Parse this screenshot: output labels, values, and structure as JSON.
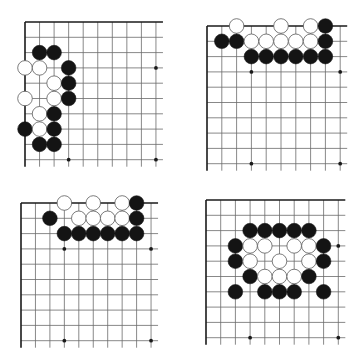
{
  "diagram": {
    "colors": {
      "background": "#ffffff",
      "grid": "#6a6a6a",
      "edge": "#1a1a1a",
      "black_stone": "#141414",
      "white_stone": "#ffffff",
      "white_outline": "#5a5a5a"
    },
    "stone_radius": 7.3,
    "boards": [
      {
        "name": "board-top-left",
        "origin": [
          25,
          22
        ],
        "step": [
          14.55,
          15.3
        ],
        "size": [
          10,
          10
        ],
        "edges": [
          "top",
          "left"
        ],
        "overhang": 7,
        "star_points": [
          [
            9,
            3
          ],
          [
            3,
            9
          ],
          [
            9,
            9
          ]
        ],
        "stones": [
          {
            "c": 1,
            "r": 2,
            "color": "black"
          },
          {
            "c": 2,
            "r": 2,
            "color": "black"
          },
          {
            "c": 0,
            "r": 3,
            "color": "white"
          },
          {
            "c": 1,
            "r": 3,
            "color": "white"
          },
          {
            "c": 3,
            "r": 3,
            "color": "black"
          },
          {
            "c": 2,
            "r": 4,
            "color": "white"
          },
          {
            "c": 3,
            "r": 4,
            "color": "black"
          },
          {
            "c": 0,
            "r": 5,
            "color": "white"
          },
          {
            "c": 2,
            "r": 5,
            "color": "white"
          },
          {
            "c": 3,
            "r": 5,
            "color": "black"
          },
          {
            "c": 1,
            "r": 6,
            "color": "white"
          },
          {
            "c": 2,
            "r": 6,
            "color": "black"
          },
          {
            "c": 0,
            "r": 7,
            "color": "black"
          },
          {
            "c": 1,
            "r": 7,
            "color": "white"
          },
          {
            "c": 2,
            "r": 7,
            "color": "black"
          },
          {
            "c": 1,
            "r": 8,
            "color": "black"
          },
          {
            "c": 2,
            "r": 8,
            "color": "black"
          }
        ]
      },
      {
        "name": "board-top-right",
        "origin": [
          207,
          26
        ],
        "step": [
          14.8,
          15.3
        ],
        "size": [
          10,
          10
        ],
        "edges": [
          "top",
          "left"
        ],
        "overhang": 7,
        "star_points": [
          [
            3,
            3
          ],
          [
            9,
            3
          ],
          [
            3,
            9
          ],
          [
            9,
            9
          ]
        ],
        "stones": [
          {
            "c": 2,
            "r": 0,
            "color": "white"
          },
          {
            "c": 5,
            "r": 0,
            "color": "white"
          },
          {
            "c": 7,
            "r": 0,
            "color": "white"
          },
          {
            "c": 8,
            "r": 0,
            "color": "black"
          },
          {
            "c": 1,
            "r": 1,
            "color": "black"
          },
          {
            "c": 2,
            "r": 1,
            "color": "black"
          },
          {
            "c": 3,
            "r": 1,
            "color": "white"
          },
          {
            "c": 4,
            "r": 1,
            "color": "white"
          },
          {
            "c": 5,
            "r": 1,
            "color": "white"
          },
          {
            "c": 6,
            "r": 1,
            "color": "white"
          },
          {
            "c": 7,
            "r": 1,
            "color": "white"
          },
          {
            "c": 8,
            "r": 1,
            "color": "black"
          },
          {
            "c": 3,
            "r": 2,
            "color": "black"
          },
          {
            "c": 4,
            "r": 2,
            "color": "black"
          },
          {
            "c": 5,
            "r": 2,
            "color": "black"
          },
          {
            "c": 6,
            "r": 2,
            "color": "black"
          },
          {
            "c": 7,
            "r": 2,
            "color": "black"
          },
          {
            "c": 8,
            "r": 2,
            "color": "black"
          }
        ]
      },
      {
        "name": "board-bottom-left",
        "origin": [
          21,
          203
        ],
        "step": [
          14.45,
          15.3
        ],
        "size": [
          10,
          10
        ],
        "edges": [
          "top",
          "left"
        ],
        "overhang": 7,
        "star_points": [
          [
            3,
            3
          ],
          [
            9,
            3
          ],
          [
            3,
            9
          ],
          [
            9,
            9
          ]
        ],
        "stones": [
          {
            "c": 3,
            "r": 0,
            "color": "white"
          },
          {
            "c": 5,
            "r": 0,
            "color": "white"
          },
          {
            "c": 7,
            "r": 0,
            "color": "white"
          },
          {
            "c": 8,
            "r": 0,
            "color": "black"
          },
          {
            "c": 2,
            "r": 1,
            "color": "black"
          },
          {
            "c": 4,
            "r": 1,
            "color": "white"
          },
          {
            "c": 5,
            "r": 1,
            "color": "white"
          },
          {
            "c": 6,
            "r": 1,
            "color": "white"
          },
          {
            "c": 7,
            "r": 1,
            "color": "white"
          },
          {
            "c": 8,
            "r": 1,
            "color": "black"
          },
          {
            "c": 3,
            "r": 2,
            "color": "black"
          },
          {
            "c": 4,
            "r": 2,
            "color": "black"
          },
          {
            "c": 5,
            "r": 2,
            "color": "black"
          },
          {
            "c": 6,
            "r": 2,
            "color": "black"
          },
          {
            "c": 7,
            "r": 2,
            "color": "black"
          },
          {
            "c": 8,
            "r": 2,
            "color": "black"
          }
        ]
      },
      {
        "name": "board-bottom-right",
        "origin": [
          206,
          200
        ],
        "step": [
          14.7,
          15.3
        ],
        "size": [
          10,
          10
        ],
        "edges": [
          "top",
          "left"
        ],
        "overhang": 7,
        "star_points": [
          [
            9,
            3
          ],
          [
            3,
            9
          ],
          [
            9,
            9
          ]
        ],
        "stones": [
          {
            "c": 3,
            "r": 2,
            "color": "black"
          },
          {
            "c": 4,
            "r": 2,
            "color": "black"
          },
          {
            "c": 5,
            "r": 2,
            "color": "black"
          },
          {
            "c": 6,
            "r": 2,
            "color": "black"
          },
          {
            "c": 7,
            "r": 2,
            "color": "black"
          },
          {
            "c": 2,
            "r": 3,
            "color": "black"
          },
          {
            "c": 3,
            "r": 3,
            "color": "white"
          },
          {
            "c": 4,
            "r": 3,
            "color": "white"
          },
          {
            "c": 6,
            "r": 3,
            "color": "white"
          },
          {
            "c": 7,
            "r": 3,
            "color": "white"
          },
          {
            "c": 8,
            "r": 3,
            "color": "black"
          },
          {
            "c": 2,
            "r": 4,
            "color": "black"
          },
          {
            "c": 3,
            "r": 4,
            "color": "white"
          },
          {
            "c": 5,
            "r": 4,
            "color": "white"
          },
          {
            "c": 7,
            "r": 4,
            "color": "white"
          },
          {
            "c": 8,
            "r": 4,
            "color": "black"
          },
          {
            "c": 3,
            "r": 5,
            "color": "black"
          },
          {
            "c": 4,
            "r": 5,
            "color": "white"
          },
          {
            "c": 5,
            "r": 5,
            "color": "white"
          },
          {
            "c": 6,
            "r": 5,
            "color": "white"
          },
          {
            "c": 7,
            "r": 5,
            "color": "black"
          },
          {
            "c": 2,
            "r": 6,
            "color": "black"
          },
          {
            "c": 4,
            "r": 6,
            "color": "black"
          },
          {
            "c": 5,
            "r": 6,
            "color": "black"
          },
          {
            "c": 6,
            "r": 6,
            "color": "black"
          },
          {
            "c": 8,
            "r": 6,
            "color": "black"
          }
        ]
      }
    ]
  }
}
